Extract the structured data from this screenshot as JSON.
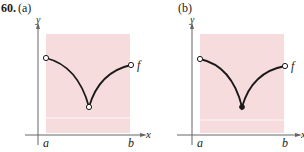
{
  "problem": {
    "number": "60.",
    "panels": [
      {
        "label": "(a)",
        "axes": {
          "x": "x",
          "y": "y"
        },
        "ticks": {
          "a": "a",
          "b": "b"
        },
        "function_label": "f",
        "min_point": "open"
      },
      {
        "label": "(b)",
        "axes": {
          "x": "x",
          "y": "y"
        },
        "ticks": {
          "a": "a",
          "b": "b"
        },
        "function_label": "f",
        "min_point": "closed"
      }
    ]
  },
  "colors": {
    "shade": "#f6dcdc",
    "curve": "#1a1a1a",
    "axis": "#555555"
  }
}
